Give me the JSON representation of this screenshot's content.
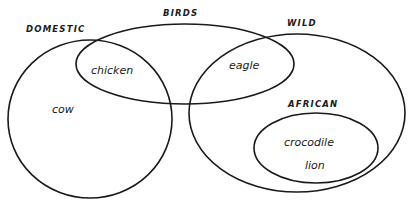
{
  "diagram": {
    "type": "venn",
    "colors": {
      "stroke": "#1a1a1a",
      "background": "#ffffff"
    },
    "sets": [
      {
        "id": "domestic",
        "label": "DOMESTIC",
        "shape": {
          "cx": 90,
          "cy": 119,
          "rx": 82,
          "ry": 79
        },
        "label_pos": {
          "x": 26,
          "y": 32
        }
      },
      {
        "id": "birds",
        "label": "BIRDS",
        "shape": {
          "cx": 185,
          "cy": 64,
          "rx": 109,
          "ry": 40
        },
        "label_pos": {
          "x": 163,
          "y": 16
        }
      },
      {
        "id": "wild",
        "label": "WILD",
        "shape": {
          "cx": 297,
          "cy": 113,
          "rx": 108,
          "ry": 79
        },
        "label_pos": {
          "x": 287,
          "y": 26
        }
      },
      {
        "id": "african",
        "label": "AFRICAN",
        "shape": {
          "cx": 316,
          "cy": 148,
          "rx": 62,
          "ry": 35
        },
        "label_pos": {
          "x": 288,
          "y": 107
        }
      }
    ],
    "members": [
      {
        "id": "chicken",
        "label": "chicken",
        "sets": [
          "domestic",
          "birds"
        ],
        "pos": {
          "x": 91,
          "y": 74
        }
      },
      {
        "id": "eagle",
        "label": "eagle",
        "sets": [
          "birds",
          "wild"
        ],
        "pos": {
          "x": 229,
          "y": 69
        }
      },
      {
        "id": "cow",
        "label": "cow",
        "sets": [
          "domestic"
        ],
        "pos": {
          "x": 52,
          "y": 113
        }
      },
      {
        "id": "crocodile",
        "label": "crocodile",
        "sets": [
          "wild",
          "african"
        ],
        "pos": {
          "x": 284,
          "y": 146
        }
      },
      {
        "id": "lion",
        "label": "lion",
        "sets": [
          "wild",
          "african"
        ],
        "pos": {
          "x": 305,
          "y": 169
        }
      }
    ]
  }
}
